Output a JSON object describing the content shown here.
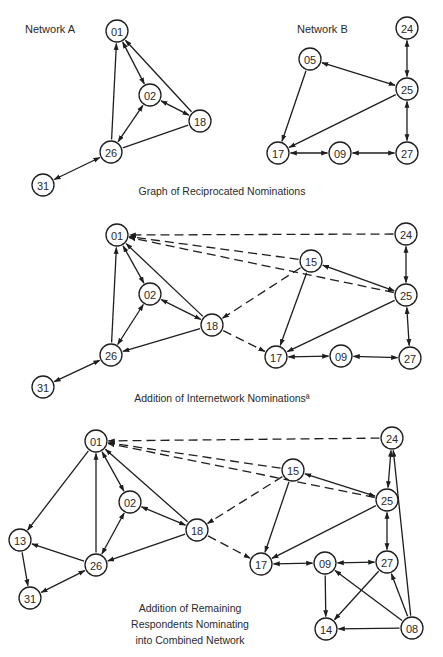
{
  "colors": {
    "ink": "#1e1e1e",
    "background": "#ffffff"
  },
  "node_radius": 11,
  "panels": [
    {
      "id": "reciprocated",
      "caption": [
        "Graph of Reciprocated Nominations"
      ],
      "caption_pos": [
        222,
        195
      ],
      "labels": [
        {
          "text": "Network A",
          "x": 25,
          "y": 33
        },
        {
          "text": "Network B",
          "x": 297,
          "y": 33
        }
      ],
      "nodes": [
        {
          "id": "01",
          "x": 117,
          "y": 31
        },
        {
          "id": "02",
          "x": 150,
          "y": 95
        },
        {
          "id": "18",
          "x": 200,
          "y": 121
        },
        {
          "id": "26",
          "x": 111,
          "y": 152
        },
        {
          "id": "31",
          "x": 43,
          "y": 185
        },
        {
          "id": "24",
          "x": 407,
          "y": 28
        },
        {
          "id": "05",
          "x": 310,
          "y": 59
        },
        {
          "id": "25",
          "x": 407,
          "y": 89
        },
        {
          "id": "17",
          "x": 278,
          "y": 153
        },
        {
          "id": "09",
          "x": 340,
          "y": 153
        },
        {
          "id": "27",
          "x": 407,
          "y": 153
        }
      ],
      "edges": [
        {
          "from": "26",
          "to": "01",
          "type": "solid",
          "dir": "forward"
        },
        {
          "from": "01",
          "to": "02",
          "type": "solid",
          "dir": "both"
        },
        {
          "from": "18",
          "to": "01",
          "type": "solid",
          "dir": "forward"
        },
        {
          "from": "02",
          "to": "18",
          "type": "solid",
          "dir": "both"
        },
        {
          "from": "02",
          "to": "26",
          "type": "solid",
          "dir": "both"
        },
        {
          "from": "18",
          "to": "26",
          "type": "solid",
          "dir": "none"
        },
        {
          "from": "31",
          "to": "26",
          "type": "solid",
          "dir": "both"
        },
        {
          "from": "24",
          "to": "25",
          "type": "solid",
          "dir": "both"
        },
        {
          "from": "05",
          "to": "25",
          "type": "solid",
          "dir": "both"
        },
        {
          "from": "05",
          "to": "17",
          "type": "solid",
          "dir": "forward"
        },
        {
          "from": "25",
          "to": "17",
          "type": "solid",
          "dir": "forward"
        },
        {
          "from": "25",
          "to": "27",
          "type": "solid",
          "dir": "both"
        },
        {
          "from": "17",
          "to": "09",
          "type": "solid",
          "dir": "both"
        },
        {
          "from": "09",
          "to": "27",
          "type": "solid",
          "dir": "both"
        }
      ]
    },
    {
      "id": "internetwork",
      "caption": [
        "Addition of Internetwork Nominationsª"
      ],
      "caption_pos": [
        222,
        402
      ],
      "labels": [],
      "nodes": [
        {
          "id": "01",
          "x": 117,
          "y": 235
        },
        {
          "id": "02",
          "x": 150,
          "y": 294
        },
        {
          "id": "18",
          "x": 212,
          "y": 325
        },
        {
          "id": "26",
          "x": 111,
          "y": 355
        },
        {
          "id": "31",
          "x": 43,
          "y": 387
        },
        {
          "id": "24",
          "x": 406,
          "y": 234
        },
        {
          "id": "15",
          "x": 311,
          "y": 261
        },
        {
          "id": "25",
          "x": 406,
          "y": 295
        },
        {
          "id": "17",
          "x": 276,
          "y": 357
        },
        {
          "id": "09",
          "x": 341,
          "y": 356
        },
        {
          "id": "27",
          "x": 410,
          "y": 358
        }
      ],
      "edges": [
        {
          "from": "26",
          "to": "01",
          "type": "solid",
          "dir": "forward"
        },
        {
          "from": "01",
          "to": "02",
          "type": "solid",
          "dir": "both"
        },
        {
          "from": "18",
          "to": "01",
          "type": "solid",
          "dir": "forward"
        },
        {
          "from": "02",
          "to": "18",
          "type": "solid",
          "dir": "both"
        },
        {
          "from": "02",
          "to": "26",
          "type": "solid",
          "dir": "both"
        },
        {
          "from": "18",
          "to": "26",
          "type": "solid",
          "dir": "forward"
        },
        {
          "from": "31",
          "to": "26",
          "type": "solid",
          "dir": "both"
        },
        {
          "from": "24",
          "to": "01",
          "type": "dashed",
          "dir": "forward"
        },
        {
          "from": "15",
          "to": "01",
          "type": "dashed",
          "dir": "forward"
        },
        {
          "from": "25",
          "to": "01",
          "type": "dashed",
          "dir": "forward"
        },
        {
          "from": "15",
          "to": "18",
          "type": "dashed",
          "dir": "forward"
        },
        {
          "from": "18",
          "to": "17",
          "type": "dashed",
          "dir": "forward"
        },
        {
          "from": "15",
          "to": "25",
          "type": "solid",
          "dir": "both"
        },
        {
          "from": "15",
          "to": "17",
          "type": "solid",
          "dir": "forward"
        },
        {
          "from": "25",
          "to": "17",
          "type": "solid",
          "dir": "forward"
        },
        {
          "from": "24",
          "to": "25",
          "type": "solid",
          "dir": "both"
        },
        {
          "from": "25",
          "to": "27",
          "type": "solid",
          "dir": "both"
        },
        {
          "from": "17",
          "to": "09",
          "type": "solid",
          "dir": "both"
        },
        {
          "from": "09",
          "to": "27",
          "type": "solid",
          "dir": "both"
        }
      ]
    },
    {
      "id": "combined",
      "caption": [
        "Addition of Remaining",
        "Respondents Nominating",
        "into Combined Network"
      ],
      "caption_pos": [
        190,
        612
      ],
      "labels": [],
      "nodes": [
        {
          "id": "01",
          "x": 96,
          "y": 441
        },
        {
          "id": "02",
          "x": 130,
          "y": 502
        },
        {
          "id": "18",
          "x": 197,
          "y": 530
        },
        {
          "id": "26",
          "x": 96,
          "y": 565
        },
        {
          "id": "13",
          "x": 20,
          "y": 540
        },
        {
          "id": "31",
          "x": 30,
          "y": 598
        },
        {
          "id": "24",
          "x": 392,
          "y": 438
        },
        {
          "id": "15",
          "x": 293,
          "y": 470
        },
        {
          "id": "25",
          "x": 387,
          "y": 500
        },
        {
          "id": "17",
          "x": 261,
          "y": 564
        },
        {
          "id": "09",
          "x": 325,
          "y": 563
        },
        {
          "id": "27",
          "x": 387,
          "y": 562
        },
        {
          "id": "14",
          "x": 326,
          "y": 629
        },
        {
          "id": "08",
          "x": 412,
          "y": 628
        }
      ],
      "edges": [
        {
          "from": "26",
          "to": "01",
          "type": "solid",
          "dir": "forward"
        },
        {
          "from": "01",
          "to": "02",
          "type": "solid",
          "dir": "both"
        },
        {
          "from": "18",
          "to": "01",
          "type": "solid",
          "dir": "forward"
        },
        {
          "from": "02",
          "to": "18",
          "type": "solid",
          "dir": "both"
        },
        {
          "from": "02",
          "to": "26",
          "type": "solid",
          "dir": "both"
        },
        {
          "from": "18",
          "to": "26",
          "type": "solid",
          "dir": "forward"
        },
        {
          "from": "01",
          "to": "13",
          "type": "solid",
          "dir": "forward"
        },
        {
          "from": "26",
          "to": "13",
          "type": "solid",
          "dir": "forward"
        },
        {
          "from": "13",
          "to": "31",
          "type": "solid",
          "dir": "forward"
        },
        {
          "from": "31",
          "to": "26",
          "type": "solid",
          "dir": "both"
        },
        {
          "from": "24",
          "to": "01",
          "type": "dashed",
          "dir": "forward"
        },
        {
          "from": "15",
          "to": "01",
          "type": "dashed",
          "dir": "forward"
        },
        {
          "from": "25",
          "to": "01",
          "type": "dashed",
          "dir": "forward"
        },
        {
          "from": "15",
          "to": "18",
          "type": "dashed",
          "dir": "forward"
        },
        {
          "from": "18",
          "to": "17",
          "type": "dashed",
          "dir": "forward"
        },
        {
          "from": "15",
          "to": "25",
          "type": "solid",
          "dir": "both"
        },
        {
          "from": "15",
          "to": "17",
          "type": "solid",
          "dir": "forward"
        },
        {
          "from": "25",
          "to": "17",
          "type": "solid",
          "dir": "forward"
        },
        {
          "from": "24",
          "to": "25",
          "type": "solid",
          "dir": "both"
        },
        {
          "from": "25",
          "to": "27",
          "type": "solid",
          "dir": "both"
        },
        {
          "from": "17",
          "to": "09",
          "type": "solid",
          "dir": "both"
        },
        {
          "from": "09",
          "to": "27",
          "type": "solid",
          "dir": "both"
        },
        {
          "from": "09",
          "to": "14",
          "type": "solid",
          "dir": "forward"
        },
        {
          "from": "27",
          "to": "14",
          "type": "solid",
          "dir": "forward"
        },
        {
          "from": "08",
          "to": "09",
          "type": "solid",
          "dir": "forward"
        },
        {
          "from": "08",
          "to": "27",
          "type": "solid",
          "dir": "forward"
        },
        {
          "from": "08",
          "to": "14",
          "type": "solid",
          "dir": "forward"
        },
        {
          "from": "08",
          "to": "24",
          "type": "solid",
          "dir": "forward"
        }
      ]
    }
  ]
}
